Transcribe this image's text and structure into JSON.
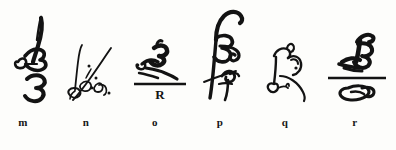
{
  "plate": {
    "title": "Monogram specimen plate",
    "background_color": "#fdfdfb",
    "ink_color": "#131313",
    "width": 396,
    "height": 150,
    "specimen_count": 6
  },
  "captions": [
    {
      "label": "m",
      "x": 23
    },
    {
      "label": "n",
      "x": 86
    },
    {
      "label": "o",
      "x": 155
    },
    {
      "label": "p",
      "x": 220
    },
    {
      "label": "q",
      "x": 285
    },
    {
      "label": "r",
      "x": 355
    }
  ],
  "specimens": [
    {
      "id": "m",
      "caption": "m",
      "description": "Stacked cursive B monogram with upward flag stroke and a looped 3-like form beneath",
      "x": 8,
      "width": 60,
      "has_rule": false,
      "rule_letter": "",
      "stroke_weight": "medium"
    },
    {
      "id": "n",
      "caption": "n",
      "description": "Fine script initials with a long rising diagonal slash and accent dots",
      "x": 62,
      "width": 58,
      "has_rule": false,
      "rule_letter": "",
      "stroke_weight": "fine"
    },
    {
      "id": "o",
      "caption": "o",
      "description": "Compact bold monogram seated on a horizontal rule with a capital R below",
      "x": 126,
      "width": 68,
      "has_rule": true,
      "rule_letter": "R",
      "stroke_weight": "bold"
    },
    {
      "id": "p",
      "caption": "p",
      "description": "Tall elaborate signature with long descending shaft crossed by a diagonal and an f-flourish",
      "x": 192,
      "width": 66,
      "has_rule": false,
      "rule_letter": "",
      "stroke_weight": "medium"
    },
    {
      "id": "q",
      "caption": "q",
      "description": "Simple open loop monogram with sweeping curved tail",
      "x": 258,
      "width": 62,
      "has_rule": false,
      "rule_letter": "",
      "stroke_weight": "fine"
    },
    {
      "id": "r",
      "caption": "r",
      "description": "Heavy B-form monogram above a horizontal rule with an oval paraph looping beneath",
      "x": 322,
      "width": 70,
      "has_rule": true,
      "rule_letter": "",
      "stroke_weight": "bold"
    }
  ]
}
